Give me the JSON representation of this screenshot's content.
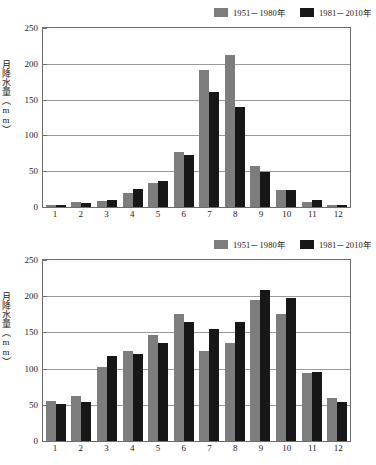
{
  "colors": {
    "series_a": "#7d7d7d",
    "series_b": "#171717",
    "axis": "#6d6d6d",
    "grid": "#9a9a9a",
    "background": "#ffffff"
  },
  "charts": [
    {
      "id": "upper-chart",
      "legend": [
        {
          "label": "1951－1980年",
          "color": "#7d7d7d",
          "swatch": "gray"
        },
        {
          "label": "1981－2010年",
          "color": "#171717",
          "swatch": "black"
        }
      ],
      "ylabel": "月降水量（mm）",
      "yticks": [
        "0",
        "50",
        "100",
        "150",
        "200",
        "250"
      ],
      "xticks": [
        "1",
        "2",
        "3",
        "4",
        "5",
        "6",
        "7",
        "8",
        "9",
        "10",
        "11",
        "12"
      ]
    },
    {
      "id": "lower-chart",
      "legend": [
        {
          "label": "1951－1980年",
          "color": "#7d7d7d",
          "swatch": "gray"
        },
        {
          "label": "1981－2010年",
          "color": "#171717",
          "swatch": "black"
        }
      ],
      "ylabel": "月降水量（mm）",
      "yticks": [
        "0",
        "50",
        "100",
        "150",
        "200",
        "250"
      ],
      "xticks": [
        "1",
        "2",
        "3",
        "4",
        "5",
        "6",
        "7",
        "8",
        "9",
        "10",
        "11",
        "12"
      ]
    }
  ],
  "chart_data": [
    {
      "type": "bar",
      "title": "",
      "xlabel": "",
      "ylabel": "月降水量（mm）",
      "categories": [
        "1",
        "2",
        "3",
        "4",
        "5",
        "6",
        "7",
        "8",
        "9",
        "10",
        "11",
        "12"
      ],
      "series": [
        {
          "name": "1951－1980年",
          "color": "#7d7d7d",
          "values": [
            3,
            7,
            9,
            19,
            33,
            77,
            192,
            212,
            57,
            24,
            7,
            3
          ]
        },
        {
          "name": "1981－2010年",
          "color": "#171717",
          "values": [
            3,
            5,
            10,
            25,
            37,
            72,
            160,
            139,
            49,
            24,
            10,
            3
          ]
        }
      ],
      "ylim": [
        0,
        250
      ],
      "ytick_step": 50,
      "grid": true,
      "legend_position": "top-right"
    },
    {
      "type": "bar",
      "title": "",
      "xlabel": "",
      "ylabel": "月降水量（mm）",
      "categories": [
        "1",
        "2",
        "3",
        "4",
        "5",
        "6",
        "7",
        "8",
        "9",
        "10",
        "11",
        "12"
      ],
      "series": [
        {
          "name": "1951－1980年",
          "color": "#7d7d7d",
          "values": [
            55,
            62,
            102,
            124,
            146,
            176,
            125,
            136,
            195,
            175,
            94,
            59
          ]
        },
        {
          "name": "1981－2010年",
          "color": "#171717",
          "values": [
            51,
            54,
            117,
            120,
            136,
            165,
            155,
            165,
            209,
            198,
            95,
            54
          ]
        }
      ],
      "ylim": [
        0,
        250
      ],
      "ytick_step": 50,
      "grid": true,
      "legend_position": "top-right"
    }
  ]
}
